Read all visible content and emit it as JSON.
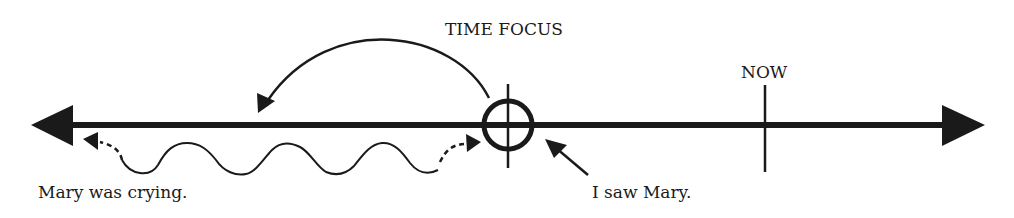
{
  "diagram": {
    "labels": {
      "time_focus": "TIME FOCUS",
      "now": "NOW",
      "past_progressive": "Mary was crying.",
      "past_simple": "I saw Mary."
    },
    "elements": {
      "timeline": "horizontal time axis with arrows at both ends",
      "time_focus_marker": "circle with vertical tick at the moment of 'I saw Mary.'",
      "now_marker": "vertical tick labeled NOW",
      "focus_arrow": "curved arrow from time focus pointing back into the past",
      "ongoing_activity": "wavy line with dashed arrows extending in both directions",
      "event_pointer": "arrow pointing from 'I saw Mary.' to the time focus marker"
    },
    "colors": {
      "ink": "#1a1a1a",
      "background": "#ffffff"
    }
  }
}
